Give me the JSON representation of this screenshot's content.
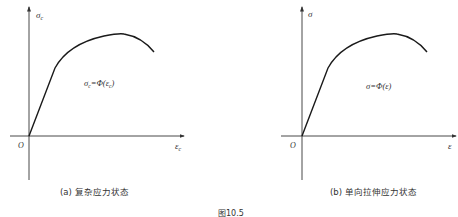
{
  "figure": {
    "number_label": "图10.5",
    "panels": [
      {
        "id": "a",
        "caption": "(a) 复杂应力状态",
        "y_axis_label": "σ",
        "y_axis_sub": "c",
        "x_axis_label": "ε",
        "x_axis_sub": "c",
        "origin_label": "O",
        "formula_lhs": "σ",
        "formula_lhs_sub": "c",
        "formula_eq": "=Φ(",
        "formula_arg": "ε",
        "formula_arg_sub": "c",
        "formula_close": ")"
      },
      {
        "id": "b",
        "caption": "(b) 单向拉伸应力状态",
        "y_axis_label": "σ",
        "x_axis_label": "ε",
        "origin_label": "O",
        "formula": "σ=Φ(ε)"
      }
    ]
  },
  "colors": {
    "axis": "#333333",
    "curve": "#1a1a1a",
    "text": "#333333"
  }
}
